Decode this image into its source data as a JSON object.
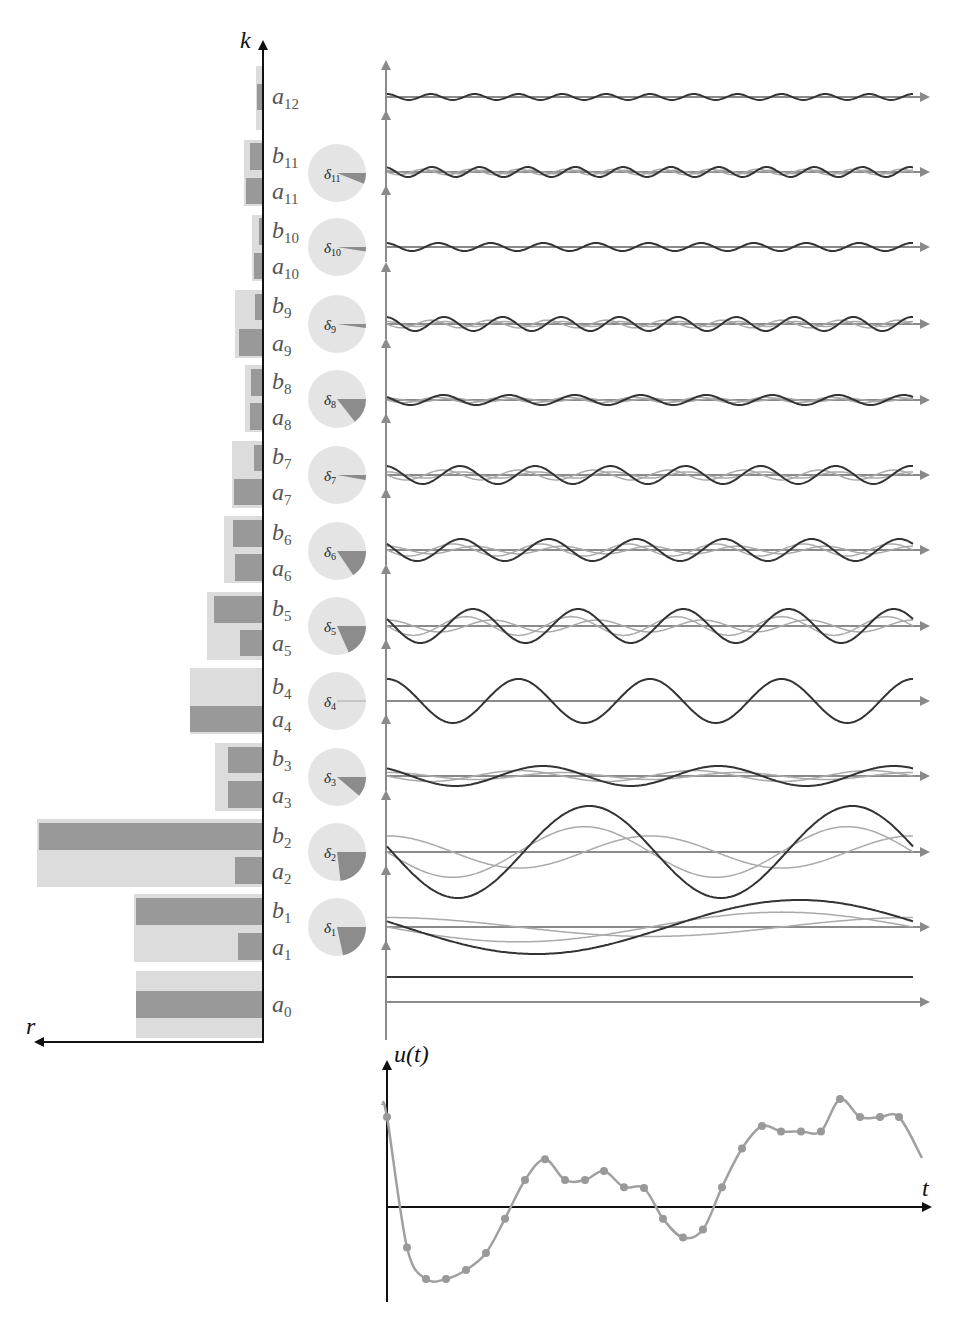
{
  "labels": {
    "k_axis": "k",
    "r_axis": "r",
    "u_axis": "u(t)",
    "t_axis": "t"
  },
  "colors": {
    "bar_light": "#dcdcdc",
    "bar_dark": "#999999",
    "pie_bg": "#e4e4e4",
    "pie_slice": "#8c8c8c",
    "axis_black": "#111111",
    "axis_gray": "#8a8a8a",
    "wave_dark": "#333333",
    "wave_light": "#aaaaaa",
    "signal": "#a0a0a0",
    "sample_dot": "#999999"
  },
  "chart_data": [
    {
      "type": "bar",
      "title": "Fourier coefficient magnitudes",
      "xlabel": "r",
      "ylabel": "k",
      "orientation": "horizontal-leftward",
      "categories": [
        "0",
        "1",
        "2",
        "3",
        "4",
        "5",
        "6",
        "7",
        "8",
        "9",
        "10",
        "11",
        "12"
      ],
      "series": [
        {
          "name": "r_k (magnitude, light bar)",
          "values": [
            126,
            128,
            225,
            47,
            72,
            55,
            38,
            30,
            17,
            27,
            10,
            18,
            6
          ]
        },
        {
          "name": "|a_k|",
          "values": [
            126,
            24,
            27,
            34,
            72,
            22,
            27,
            28,
            12,
            23,
            8,
            16,
            5
          ]
        },
        {
          "name": "|b_k|",
          "values": [
            0,
            126,
            223,
            34,
            0,
            48,
            29,
            8,
            11,
            7,
            3,
            12,
            0
          ]
        }
      ],
      "row_labels": [
        "a0",
        "b1/a1",
        "b2/a2",
        "b3/a3",
        "b4/a4",
        "b5/a5",
        "b6/a6",
        "b7/a7",
        "b8/a8",
        "b9/a9",
        "b10/a10",
        "b11/a11",
        "a12"
      ]
    },
    {
      "type": "pie",
      "title": "Phase angles delta_k",
      "pies": [
        {
          "label": "δ1",
          "angle_deg": 78
        },
        {
          "label": "δ2",
          "angle_deg": 83
        },
        {
          "label": "δ3",
          "angle_deg": 40
        },
        {
          "label": "δ4",
          "angle_deg": 1
        },
        {
          "label": "δ5",
          "angle_deg": 66
        },
        {
          "label": "δ6",
          "angle_deg": 56
        },
        {
          "label": "δ7",
          "angle_deg": 10
        },
        {
          "label": "δ8",
          "angle_deg": 52
        },
        {
          "label": "δ9",
          "angle_deg": 8
        },
        {
          "label": "δ10",
          "angle_deg": 9
        },
        {
          "label": "δ11",
          "angle_deg": 22
        }
      ]
    },
    {
      "type": "line",
      "title": "Harmonic components",
      "rows": [
        {
          "k": 12,
          "amplitude": 3,
          "cycles": 12,
          "phase": 0
        },
        {
          "k": 11,
          "amplitude": 5,
          "cycles": 11,
          "phase": 0.38
        },
        {
          "k": 10,
          "amplitude": 4,
          "cycles": 10,
          "phase": 0.16
        },
        {
          "k": 9,
          "amplitude": 7,
          "cycles": 9,
          "phase": 0.14
        },
        {
          "k": 8,
          "amplitude": 5,
          "cycles": 8,
          "phase": 0.9
        },
        {
          "k": 7,
          "amplitude": 9,
          "cycles": 7,
          "phase": 0.17
        },
        {
          "k": 6,
          "amplitude": 11,
          "cycles": 6,
          "phase": 0.98
        },
        {
          "k": 5,
          "amplitude": 17,
          "cycles": 5,
          "phase": 1.15
        },
        {
          "k": 4,
          "amplitude": 22,
          "cycles": 4,
          "phase": 0.0
        },
        {
          "k": 3,
          "amplitude": 10,
          "cycles": 3,
          "phase": 0.7
        },
        {
          "k": 2,
          "amplitude": 46,
          "cycles": 2,
          "phase": 1.45
        },
        {
          "k": 1,
          "amplitude": 27,
          "cycles": 1,
          "phase": 1.36
        },
        {
          "k": 0,
          "amplitude": 25,
          "cycles": 0,
          "phase": 0
        }
      ]
    },
    {
      "type": "line",
      "title": "u(t)",
      "xlabel": "t",
      "ylabel": "u(t)",
      "samples_x": [
        387,
        407,
        426,
        446,
        466,
        486,
        505,
        525,
        545,
        565,
        585,
        604,
        624,
        644,
        663,
        683,
        703,
        722,
        742,
        762,
        781,
        801,
        821,
        840,
        860,
        880,
        899,
        915
      ],
      "samples_y": [
        100,
        -45,
        -80,
        -80,
        -70,
        -51,
        -13,
        30,
        53,
        30,
        30,
        40,
        22,
        21,
        -13,
        -34,
        -25,
        22,
        65,
        90,
        84,
        84,
        84,
        120,
        100,
        100,
        100,
        100
      ]
    }
  ]
}
